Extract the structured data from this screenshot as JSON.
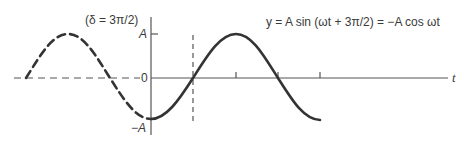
{
  "diagram": {
    "title_equation": "y = A sin (ωt + 3π/2) = −A cos ωt",
    "phase_label": "(δ = 3π/2)",
    "y_axis": {
      "labels": {
        "top": "A",
        "zero": "0",
        "bottom": "−A"
      }
    },
    "x_axis": {
      "label": "t",
      "tick_count": 3
    },
    "curves": [
      {
        "name": "reference",
        "style": "dashed",
        "description": "shifted sine, earlier time"
      },
      {
        "name": "phase-shifted",
        "style": "solid",
        "description": "y = −A cos ωt"
      }
    ],
    "colors": {
      "stroke": "#333333",
      "axis": "#555555",
      "text": "#3a3a3a"
    }
  }
}
